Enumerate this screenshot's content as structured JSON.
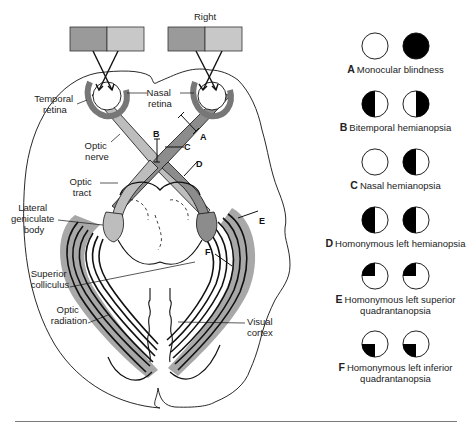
{
  "diagram": {
    "title_label": "Right",
    "labels": {
      "temporal_retina": [
        "Temporal",
        "retina"
      ],
      "nasal_retina": [
        "Nasal",
        "retina"
      ],
      "optic_nerve": [
        "Optic",
        "nerve"
      ],
      "optic_tract": [
        "Optic",
        "tract"
      ],
      "lateral_geniculate_body": [
        "Lateral",
        "geniculate",
        "body"
      ],
      "superior_colliculus": [
        "Superior",
        "colliculus"
      ],
      "optic_radiation": [
        "Optic",
        "radiation"
      ],
      "visual_cortex": [
        "Visual",
        "cortex"
      ]
    },
    "lesion_markers": [
      "A",
      "B",
      "C",
      "D",
      "E",
      "F"
    ],
    "colors": {
      "field_dark": "#9a9a9a",
      "field_light": "#c8c8c8",
      "pathway_light": "#bdbdbd",
      "pathway_dark": "#8c8c8c",
      "radiation_halo": "#a8a8a8",
      "line": "#111111"
    }
  },
  "legend": [
    {
      "letter": "A",
      "text": "Monocular blindness",
      "left_eye": "clear",
      "right_eye": "full"
    },
    {
      "letter": "B",
      "text": "Bitemporal hemianopsia",
      "left_eye": "left-half",
      "right_eye": "right-half"
    },
    {
      "letter": "C",
      "text": "Nasal hemianopsia",
      "left_eye": "clear",
      "right_eye": "left-half"
    },
    {
      "letter": "D",
      "text": "Homonymous left hemianopsia",
      "left_eye": "left-half",
      "right_eye": "left-half"
    },
    {
      "letter": "E",
      "text": "Homonymous left superior quadrantanopsia",
      "text_lines": [
        "Homonymous left superior",
        "quadrantanopsia"
      ],
      "left_eye": "upper-left",
      "right_eye": "upper-left"
    },
    {
      "letter": "F",
      "text": "Homonymous left inferior quadrantanopsia",
      "text_lines": [
        "Homonymous left inferior",
        "quadrantanopsia"
      ],
      "left_eye": "lower-left",
      "right_eye": "lower-left"
    }
  ]
}
